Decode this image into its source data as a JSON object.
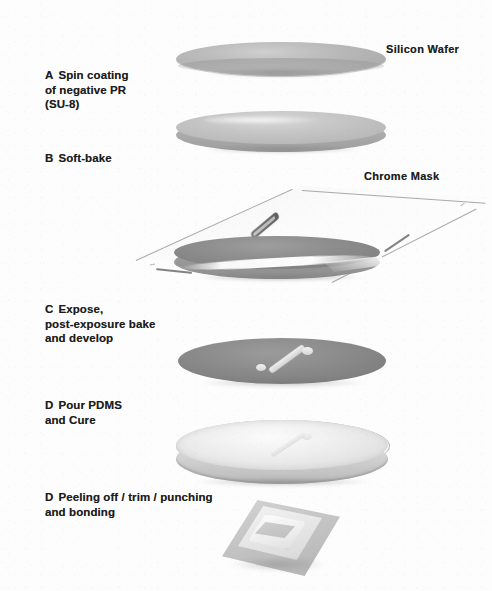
{
  "figure": {
    "background_color": "#fdfdfd",
    "ink_color": "#1d1d1d"
  },
  "steps": [
    {
      "id": "A",
      "letter": "A",
      "text": "Spin coating\nof negative PR\n(SU-8)",
      "lines": [
        "Spin coating",
        "of negative PR",
        "(SU-8)"
      ]
    },
    {
      "id": "B",
      "letter": "B",
      "text": "Soft-bake",
      "lines": [
        "Soft-bake"
      ]
    },
    {
      "id": "C",
      "letter": "C",
      "text": "Expose,\npost-exposure bake\nand develop",
      "lines": [
        "Expose,",
        "post-exposure bake",
        "and develop"
      ]
    },
    {
      "id": "D1",
      "letter": "D",
      "text": "Pour PDMS\nand Cure",
      "lines": [
        "Pour PDMS",
        "and Cure"
      ]
    },
    {
      "id": "D2",
      "letter": "D",
      "text": "Peeling off / trim / punching\nand bonding",
      "lines": [
        "Peeling off / trim / punching",
        "and bonding"
      ]
    }
  ],
  "callouts": [
    {
      "id": "silicon-wafer",
      "label": "Silicon Wafer"
    },
    {
      "id": "chrome-mask",
      "label": "Chrome Mask"
    }
  ],
  "artwork": {
    "wafer_silicon": {
      "name": "silicon-wafer-disc",
      "fill": "#bdbdbd"
    },
    "wafer_pr": {
      "name": "photoresist-coated-wafer",
      "fill": "#c7c7c7"
    },
    "mask_plate": {
      "name": "chrome-mask-plate",
      "fill": "#f4f4f4"
    },
    "wafer_exposed": {
      "name": "exposed-wafer",
      "fill": "#8e8e8e"
    },
    "wafer_developed": {
      "name": "developed-su8-mold",
      "fill": "#8c8c8c",
      "feature": "microchannel"
    },
    "pdms_disc": {
      "name": "cured-pdms-disc",
      "fill": "#f0f0f0"
    },
    "pdms_chip": {
      "name": "bonded-pdms-chip",
      "fill": "#c4c4c4"
    }
  }
}
